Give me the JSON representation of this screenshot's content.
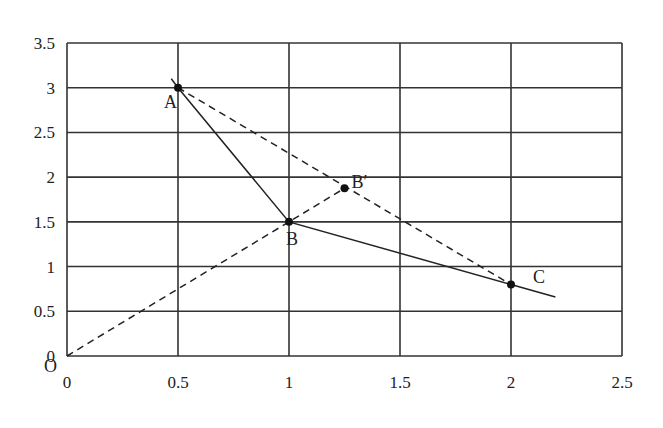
{
  "chart_data": {
    "type": "line",
    "title": "",
    "xlabel": "",
    "ylabel": "",
    "xlim": [
      0,
      2.5
    ],
    "ylim": [
      0,
      3.5
    ],
    "grid": true,
    "x_ticks": [
      "0",
      "0.5",
      "1",
      "1.5",
      "2",
      "2.5"
    ],
    "y_ticks": [
      "0",
      "0.5",
      "1",
      "1.5",
      "2",
      "2.5",
      "3",
      "3.5"
    ],
    "origin_label": "O",
    "points": [
      {
        "label": "A",
        "x": 0.5,
        "y": 3.0
      },
      {
        "label": "B",
        "x": 1.0,
        "y": 1.5
      },
      {
        "label": "B′",
        "x": 1.25,
        "y": 1.875
      },
      {
        "label": "C",
        "x": 2.0,
        "y": 0.8
      }
    ],
    "series": [
      {
        "name": "solid polyline A-B-C",
        "style": "solid",
        "x": [
          0.47,
          0.5,
          1.0,
          2.0,
          2.2
        ],
        "y": [
          3.1,
          3.0,
          1.5,
          0.8,
          0.66
        ]
      },
      {
        "name": "dashed line A-C",
        "style": "dashed",
        "x": [
          0.5,
          2.0
        ],
        "y": [
          3.0,
          0.8
        ]
      },
      {
        "name": "dashed ray O-B′",
        "style": "dashed",
        "x": [
          0,
          1.25
        ],
        "y": [
          0,
          1.875
        ]
      }
    ]
  }
}
